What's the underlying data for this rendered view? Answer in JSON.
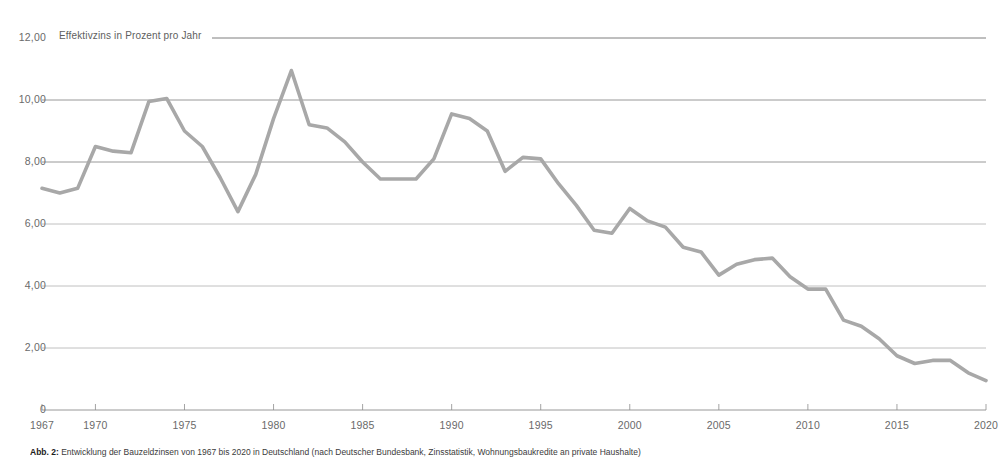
{
  "figure": {
    "caption_label": "Abb. 2:",
    "caption_text": " Entwicklung der Bauzeldzinsen von 1967 bis 2020 in Deutschland (nach Deutscher Bundesbank, Zinsstatistik, Wohnungsbaukredite an private Haushalte)"
  },
  "chart_data": {
    "type": "line",
    "title": "Effektivzins in Prozent pro Jahr",
    "xlabel": "",
    "ylabel": "Effektivzins in Prozent pro Jahr",
    "xlim": [
      1967,
      2020
    ],
    "ylim": [
      0,
      12
    ],
    "grid": true,
    "legend": "none",
    "line_color": "#a8a8a8",
    "y_ticks": [
      0,
      2,
      4,
      6,
      8,
      10,
      12
    ],
    "y_tick_labels": [
      "0",
      "2,00",
      "4,00",
      "6,00",
      "8,00",
      "10,00",
      "12,00"
    ],
    "x_ticks": [
      1967,
      1970,
      1975,
      1980,
      1985,
      1990,
      1995,
      2000,
      2005,
      2010,
      2015,
      2020
    ],
    "x_tick_labels": [
      "1967",
      "1970",
      "1975",
      "1980",
      "1985",
      "1990",
      "1995",
      "2000",
      "2005",
      "2010",
      "2015",
      "2020"
    ],
    "series": [
      {
        "name": "Effektivzins",
        "x": [
          1967,
          1968,
          1969,
          1970,
          1971,
          1972,
          1973,
          1974,
          1975,
          1976,
          1977,
          1978,
          1979,
          1980,
          1981,
          1982,
          1983,
          1984,
          1985,
          1986,
          1987,
          1988,
          1989,
          1990,
          1991,
          1992,
          1993,
          1994,
          1995,
          1996,
          1997,
          1998,
          1999,
          2000,
          2001,
          2002,
          2003,
          2004,
          2005,
          2006,
          2007,
          2008,
          2009,
          2010,
          2011,
          2012,
          2013,
          2014,
          2015,
          2016,
          2017,
          2018,
          2019,
          2020
        ],
        "values": [
          7.15,
          7.0,
          7.15,
          8.5,
          8.35,
          8.3,
          9.95,
          10.05,
          9.0,
          8.5,
          7.5,
          6.4,
          7.6,
          9.4,
          10.95,
          9.2,
          9.1,
          8.65,
          8.0,
          7.45,
          7.45,
          7.45,
          8.1,
          9.55,
          9.4,
          9.0,
          7.7,
          8.15,
          8.1,
          7.3,
          6.6,
          5.8,
          5.7,
          6.5,
          6.1,
          5.9,
          5.25,
          5.1,
          4.35,
          4.7,
          4.85,
          4.9,
          4.3,
          3.9,
          3.9,
          2.9,
          2.7,
          2.3,
          1.75,
          1.5,
          1.6,
          1.6,
          1.2,
          0.95
        ]
      }
    ]
  }
}
